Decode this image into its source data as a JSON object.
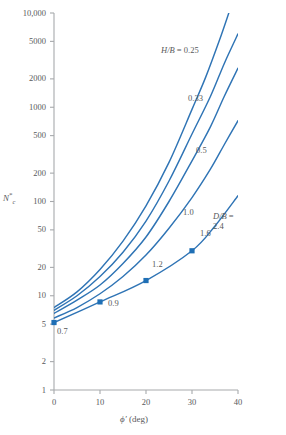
{
  "chart_data": {
    "type": "line",
    "title": "",
    "xlabel": "ϕ′ (deg)",
    "ylabel": "N*c",
    "ylabel_parts": {
      "base": "N",
      "sup": "*",
      "sub": "c"
    },
    "xlim": [
      0,
      40
    ],
    "ylim": [
      1,
      10000
    ],
    "yscale": "log",
    "xscale": "linear",
    "grid": false,
    "legend": "inline-annotations",
    "xticks": [
      0,
      10,
      20,
      30,
      40
    ],
    "xticklabels": [
      "0",
      "10",
      "20",
      "30",
      "40"
    ],
    "yticks": [
      1,
      2,
      5,
      10,
      20,
      50,
      100,
      200,
      500,
      1000,
      2000,
      5000,
      10000
    ],
    "yticklabels": [
      "1",
      "2",
      "5",
      "10",
      "20",
      "50",
      "100",
      "200",
      "500",
      "1000",
      "2000",
      "5000",
      "10,000"
    ],
    "series": [
      {
        "name": "H/B = 0.25",
        "label": "H/B = 0.25",
        "label_prefix": "H/B =",
        "label_value": "0.25",
        "x": [
          0,
          5,
          10,
          15,
          20,
          25,
          30,
          33,
          36,
          38
        ],
        "values": [
          7.5,
          11,
          19,
          38,
          90,
          260,
          950,
          2100,
          5200,
          10000
        ]
      },
      {
        "name": "H/B = 0.33",
        "label": "0.33",
        "x": [
          0,
          5,
          10,
          15,
          20,
          25,
          30,
          34,
          37,
          40
        ],
        "values": [
          7.0,
          10,
          16,
          29,
          62,
          165,
          520,
          1300,
          2900,
          6000
        ]
      },
      {
        "name": "H/B = 0.5",
        "label": "0.5",
        "x": [
          0,
          5,
          10,
          15,
          20,
          25,
          30,
          34,
          37,
          40
        ],
        "values": [
          6.5,
          9,
          13,
          22,
          42,
          100,
          270,
          620,
          1300,
          2600
        ]
      },
      {
        "name": "H/B = 1.0",
        "label": "1.0",
        "x": [
          0,
          5,
          10,
          15,
          20,
          25,
          30,
          34,
          37,
          40
        ],
        "values": [
          5.8,
          7.5,
          10.5,
          16,
          27,
          52,
          110,
          220,
          400,
          720
        ]
      },
      {
        "name": "D/B line",
        "label": "D/B = 2.4",
        "label_prefix": "D/B =",
        "label_value": "2.4",
        "x": [
          0,
          10,
          20,
          30,
          35,
          40
        ],
        "values": [
          5.2,
          8.6,
          14.5,
          30,
          55,
          115
        ],
        "markers": [
          {
            "x": 0,
            "y": 5.2,
            "label": "0.7"
          },
          {
            "x": 10,
            "y": 8.6,
            "label": "0.9"
          },
          {
            "x": 20,
            "y": 14.5,
            "label": "1.2"
          },
          {
            "x": 30,
            "y": 30,
            "label": "1.6"
          }
        ]
      }
    ],
    "annotations": [
      {
        "text": "H/B = 0.25"
      },
      {
        "text": "0.33"
      },
      {
        "text": "0.5"
      },
      {
        "text": "1.0"
      },
      {
        "text": "1.6"
      },
      {
        "text": "1.2"
      },
      {
        "text": "0.9"
      },
      {
        "text": "0.7"
      },
      {
        "text": "D/B ="
      },
      {
        "text": "2.4"
      }
    ],
    "colors": {
      "curve": "#2f74b5",
      "marker": "#1f6fb5",
      "axis": "#a7a9ac",
      "text": "#58595b"
    }
  },
  "axis": {
    "y_title_base": "N",
    "y_title_sup": "*",
    "y_title_sub": "c",
    "x_title_sym": "ϕ′",
    "x_title_unit": "(deg)"
  }
}
